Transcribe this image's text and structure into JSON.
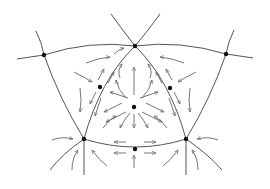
{
  "diagram": {
    "type": "vector-field-phase-portrait",
    "size": {
      "width": 270,
      "height": 189
    },
    "colors": {
      "background": "#ffffff",
      "curve": "#555555",
      "arrow": "#666666",
      "node": "#111111"
    },
    "nodes": [
      {
        "id": "top",
        "x": 135,
        "y": 46,
        "kind": "saddle"
      },
      {
        "id": "center",
        "x": 134,
        "y": 107,
        "kind": "source"
      },
      {
        "id": "left-mid",
        "x": 100,
        "y": 87,
        "kind": "saddle"
      },
      {
        "id": "right-mid",
        "x": 170,
        "y": 88,
        "kind": "saddle"
      },
      {
        "id": "bottom-left",
        "x": 84,
        "y": 139,
        "kind": "sink"
      },
      {
        "id": "bottom-right",
        "x": 186,
        "y": 139,
        "kind": "sink"
      },
      {
        "id": "bottom-mid",
        "x": 135,
        "y": 149,
        "kind": "saddle"
      },
      {
        "id": "outer-left",
        "x": 44,
        "y": 55,
        "kind": "saddle"
      },
      {
        "id": "outer-right",
        "x": 226,
        "y": 54,
        "kind": "saddle"
      }
    ],
    "curves": [
      {
        "id": "top-left-branch",
        "d": "M111,14 Q124,32 135,46"
      },
      {
        "id": "top-right-branch",
        "d": "M160,14 Q147,32 135,46"
      },
      {
        "id": "top-arc-left",
        "d": "M135,46 Q90,40 44,55"
      },
      {
        "id": "top-arc-right",
        "d": "M135,46 Q180,40 226,54"
      },
      {
        "id": "outer-left-tail",
        "d": "M44,55 Q30,57 17,59"
      },
      {
        "id": "outer-right-tail",
        "d": "M226,54 Q240,56 253,58"
      },
      {
        "id": "outer-left-vertical",
        "d": "M36,31 Q42,43 44,55 Q60,100 84,139"
      },
      {
        "id": "outer-right-vertical",
        "d": "M234,30 Q228,42 226,54 Q210,100 186,139"
      },
      {
        "id": "tri-left",
        "d": "M135,46 Q100,80 84,139"
      },
      {
        "id": "tri-right",
        "d": "M135,46 Q170,80 186,139"
      },
      {
        "id": "tri-bottom",
        "d": "M84,139 Q135,155 186,139"
      },
      {
        "id": "bl-down",
        "d": "M84,139 L84,175"
      },
      {
        "id": "br-down",
        "d": "M186,139 L186,175"
      },
      {
        "id": "bl-sw",
        "d": "M84,139 Q62,154 50,170"
      },
      {
        "id": "br-se",
        "d": "M186,139 Q208,154 222,170"
      }
    ],
    "arrows": [
      {
        "d": "M86,63 Q98,58 110,57"
      },
      {
        "d": "M184,63 Q172,58 160,57"
      },
      {
        "d": "M74,72 Q84,77 92,82"
      },
      {
        "d": "M196,72 Q186,77 178,82"
      },
      {
        "d": "M98,80 L104,69"
      },
      {
        "d": "M108,83 L114,72"
      },
      {
        "d": "M172,80 L166,69"
      },
      {
        "d": "M162,83 L156,72"
      },
      {
        "d": "M120,78 Q117,70 122,64"
      },
      {
        "d": "M150,78 Q153,70 148,64"
      },
      {
        "d": "M134,95 L134,67"
      },
      {
        "d": "M126,98 Q118,90 116,80"
      },
      {
        "d": "M142,98 Q150,90 152,80"
      },
      {
        "d": "M122,103 L104,112"
      },
      {
        "d": "M146,103 L164,112"
      },
      {
        "d": "M128,98 L110,92"
      },
      {
        "d": "M140,98 L158,92"
      },
      {
        "d": "M126,112 L106,122"
      },
      {
        "d": "M142,112 L162,122"
      },
      {
        "d": "M130,113 Q124,120 120,128"
      },
      {
        "d": "M138,113 Q144,120 148,128"
      },
      {
        "d": "M134,114 L134,128"
      },
      {
        "d": "M96,92 L90,104"
      },
      {
        "d": "M174,92 L180,104"
      },
      {
        "d": "M80,88 Q82,100 80,112"
      },
      {
        "d": "M190,88 Q188,100 190,112"
      },
      {
        "d": "M101,98 L95,116"
      },
      {
        "d": "M169,98 L175,116"
      },
      {
        "d": "M103,128 Q108,120 116,116"
      },
      {
        "d": "M167,128 Q162,120 154,116"
      },
      {
        "d": "M126,142 L114,142"
      },
      {
        "d": "M144,142 L156,142"
      },
      {
        "d": "M126,153 L114,153"
      },
      {
        "d": "M144,153 L156,153"
      },
      {
        "d": "M134,168 L134,155"
      },
      {
        "d": "M52,140 Q62,136 73,139"
      },
      {
        "d": "M218,140 Q208,136 197,139"
      },
      {
        "d": "M72,170 Q72,158 78,150"
      },
      {
        "d": "M198,170 Q198,158 192,150"
      },
      {
        "d": "M107,166 Q99,160 92,150"
      },
      {
        "d": "M163,166 Q171,160 178,150"
      },
      {
        "d": "M114,54 Q118,50 124,48"
      }
    ]
  }
}
